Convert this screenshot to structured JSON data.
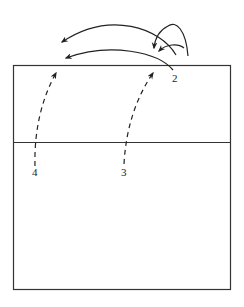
{
  "diagram": {
    "type": "folding-diagram",
    "colors": {
      "stroke": "#333333",
      "background": "#ffffff"
    },
    "rectangle": {
      "x": 13,
      "y": 65,
      "width": 218,
      "height": 225
    },
    "crease_line": {
      "y": 142
    },
    "labels": [
      {
        "id": "2",
        "text": "2",
        "x": 172,
        "y": 82
      },
      {
        "id": "3",
        "text": "3",
        "x": 121,
        "y": 176
      },
      {
        "id": "4",
        "text": "4",
        "x": 32,
        "y": 176
      }
    ],
    "arrows": [
      {
        "name": "upper-long-arc",
        "style": "solid",
        "from": [
          176,
          55
        ],
        "to": [
          62,
          42
        ]
      },
      {
        "name": "lower-long-arc",
        "style": "solid",
        "from": [
          173,
          70
        ],
        "to": [
          66,
          58
        ]
      },
      {
        "name": "loop-arrow-a",
        "style": "solid",
        "from": [
          188,
          56
        ],
        "to": [
          154,
          48
        ]
      },
      {
        "name": "loop-arrow-b",
        "style": "solid",
        "from": [
          184,
          48
        ],
        "to": [
          159,
          51
        ]
      },
      {
        "name": "dashed-arrow-4",
        "style": "dashed",
        "from": [
          35,
          166
        ],
        "to": [
          56,
          73
        ]
      },
      {
        "name": "dashed-arrow-3",
        "style": "dashed",
        "from": [
          124,
          164
        ],
        "to": [
          153,
          73
        ]
      }
    ]
  }
}
